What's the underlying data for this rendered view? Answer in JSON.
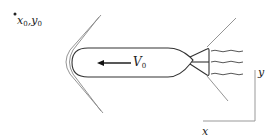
{
  "figure": {
    "type": "physics-diagram",
    "colors": {
      "body_stroke": "#333333",
      "shock_stroke": "#888888",
      "axis_stroke": "#999999",
      "text": "#222222"
    }
  },
  "labels": {
    "origin_point": {
      "x_sym": "x",
      "x_sub": "0",
      "y_sym": "y",
      "y_sub": "0"
    },
    "velocity": {
      "sym": "V",
      "sub": "0"
    },
    "axes": {
      "x": "x",
      "y": "y"
    }
  },
  "elements": {
    "origin_marker": "dot",
    "velocity_arrow_direction": "left",
    "bow_shock": "V-shaped double line ahead of nose",
    "nozzle_shock": "two oblique lines from nozzle exit",
    "exhaust_streams": 3
  }
}
